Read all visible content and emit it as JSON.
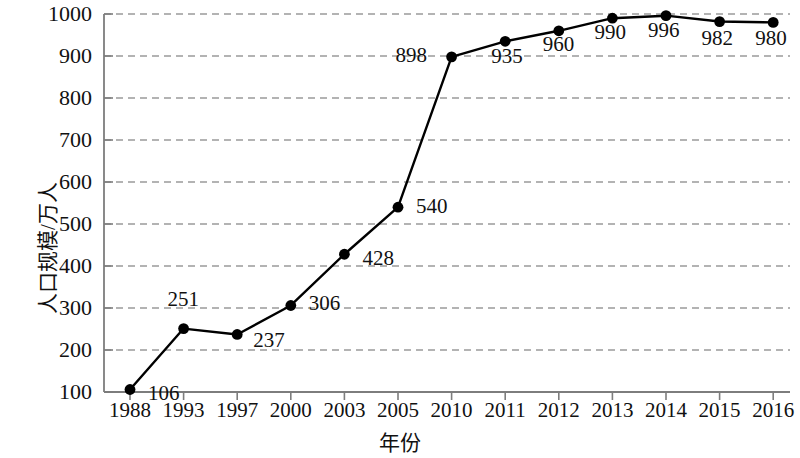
{
  "chart_data": {
    "type": "line",
    "title": "",
    "xlabel": "年份",
    "ylabel": "人口规模/万人",
    "categories": [
      "1988",
      "1993",
      "1997",
      "2000",
      "2003",
      "2005",
      "2010",
      "2011",
      "2012",
      "2013",
      "2014",
      "2015",
      "2016"
    ],
    "values": [
      106,
      251,
      237,
      306,
      428,
      540,
      898,
      935,
      960,
      990,
      996,
      982,
      980
    ],
    "point_labels": [
      "106",
      "251",
      "237",
      "306",
      "428",
      "540",
      "898",
      "935",
      "960",
      "990",
      "996",
      "982",
      "980"
    ],
    "ylim": [
      100,
      1000
    ],
    "yticks": [
      100,
      200,
      300,
      400,
      500,
      600,
      700,
      800,
      900,
      1000
    ],
    "ytick_labels": [
      "100",
      "200",
      "300",
      "400",
      "500",
      "600",
      "700",
      "800",
      "900",
      "1000"
    ],
    "grid": true,
    "grid_style": "dashed",
    "grid_color": "#9a9a9a",
    "legend": null,
    "line_color": "#000000",
    "marker": "circle",
    "marker_color": "#000000",
    "frame_color": "#7d7d7d",
    "background": "#ffffff"
  },
  "label_offsets": [
    {
      "dx": 18,
      "dy": 4
    },
    {
      "dx": -16,
      "dy": -30
    },
    {
      "dx": 16,
      "dy": 6
    },
    {
      "dx": 18,
      "dy": -2
    },
    {
      "dx": 18,
      "dy": 4
    },
    {
      "dx": 18,
      "dy": -1
    },
    {
      "dx": -56,
      "dy": -2
    },
    {
      "dx": -14,
      "dy": 15
    },
    {
      "dx": -16,
      "dy": 13
    },
    {
      "dx": -18,
      "dy": 14
    },
    {
      "dx": -18,
      "dy": 14
    },
    {
      "dx": -18,
      "dy": 16
    },
    {
      "dx": -18,
      "dy": 16
    }
  ]
}
